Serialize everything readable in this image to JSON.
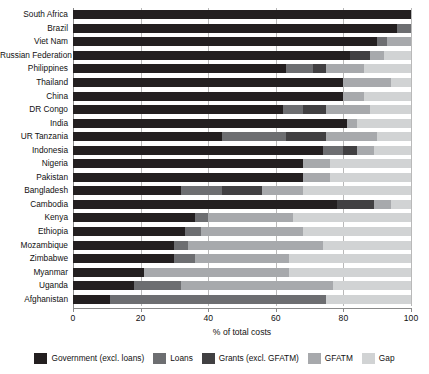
{
  "chart_data": {
    "type": "bar",
    "orientation": "horizontal",
    "stacked": true,
    "title": "",
    "xlabel": "% of total costs",
    "ylabel": "",
    "xlim": [
      0,
      100
    ],
    "xticks": [
      0,
      20,
      40,
      60,
      80,
      100
    ],
    "grid": true,
    "legend_position": "bottom",
    "categories": [
      "South Africa",
      "Brazil",
      "Viet Nam",
      "Russian Federation",
      "Philippines",
      "Thailand",
      "China",
      "DR Congo",
      "India",
      "UR Tanzania",
      "Indonesia",
      "Nigeria",
      "Pakistan",
      "Bangladesh",
      "Cambodia",
      "Kenya",
      "Ethiopia",
      "Mozambique",
      "Zimbabwe",
      "Myanmar",
      "Uganda",
      "Afghanistan"
    ],
    "series": [
      {
        "name": "Government (excl. loans)",
        "color": "#231f20",
        "values": [
          100,
          96,
          90,
          82,
          63,
          80,
          80,
          62,
          81,
          44,
          74,
          68,
          68,
          32,
          78,
          36,
          33,
          30,
          30,
          21,
          18,
          11
        ]
      },
      {
        "name": "Loans",
        "color": "#6d6e71",
        "values": [
          0,
          4,
          3,
          0,
          8,
          0,
          0,
          6,
          0,
          19,
          6,
          0,
          0,
          12,
          0,
          4,
          5,
          4,
          6,
          0,
          14,
          64
        ]
      },
      {
        "name": "Grants (excl. GFATM)",
        "color": "#414042",
        "values": [
          0,
          0,
          0,
          6,
          4,
          0,
          0,
          7,
          0,
          12,
          4,
          0,
          0,
          12,
          11,
          0,
          0,
          0,
          0,
          0,
          0,
          0
        ]
      },
      {
        "name": "GFATM",
        "color": "#a7a9ac",
        "values": [
          0,
          0,
          7,
          4,
          11,
          14,
          6,
          13,
          3,
          15,
          5,
          8,
          8,
          12,
          5,
          25,
          30,
          40,
          28,
          43,
          45,
          0
        ]
      },
      {
        "name": "Gap",
        "color": "#d1d3d4",
        "values": [
          0,
          0,
          0,
          8,
          14,
          6,
          14,
          12,
          16,
          10,
          11,
          24,
          24,
          32,
          6,
          35,
          32,
          26,
          36,
          36,
          23,
          25
        ]
      }
    ]
  },
  "axis": {
    "x_title": "% of total costs",
    "tick_labels": [
      "0",
      "20",
      "40",
      "60",
      "80",
      "100"
    ]
  },
  "legend": {
    "items": [
      {
        "label": "Government (excl. loans)",
        "color": "#231f20"
      },
      {
        "label": "Loans",
        "color": "#6d6e71"
      },
      {
        "label": "Grants (excl. GFATM)",
        "color": "#414042"
      },
      {
        "label": "GFATM",
        "color": "#a7a9ac"
      },
      {
        "label": "Gap",
        "color": "#d1d3d4"
      }
    ]
  },
  "style": {
    "gridline_color": "#b9b9b9",
    "axis_color": "#8a8a8a",
    "text_color": "#111111",
    "background": "#ffffff"
  }
}
